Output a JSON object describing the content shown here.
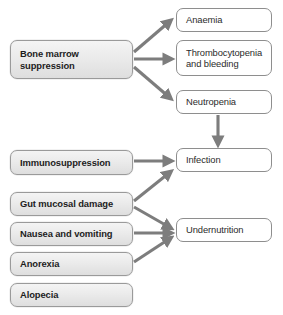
{
  "diagram": {
    "canvas": {
      "width": 283,
      "height": 315
    },
    "colors": {
      "background": "#ffffff",
      "cause_fill_top": "#f4f4f4",
      "cause_fill_bottom": "#dedede",
      "cause_border": "#9a9a9a",
      "effect_fill": "#ffffff",
      "effect_border": "#8e8e8e",
      "arrow": "#7d7d7d",
      "text": "#1d1d1d"
    },
    "nodes": [
      {
        "id": "bone-marrow-suppression",
        "label": "Bone marrow suppression",
        "kind": "cause",
        "x": 10,
        "y": 40,
        "w": 123,
        "h": 39
      },
      {
        "id": "anaemia",
        "label": "Anaemia",
        "kind": "effect",
        "x": 176,
        "y": 8,
        "w": 96,
        "h": 24
      },
      {
        "id": "thrombocytopenia-and-bleeding",
        "label": "Thrombocytopenia and bleeding",
        "kind": "effect",
        "x": 176,
        "y": 40,
        "w": 96,
        "h": 36
      },
      {
        "id": "neutropenia",
        "label": "Neutropenia",
        "kind": "effect",
        "x": 176,
        "y": 90,
        "w": 96,
        "h": 24
      },
      {
        "id": "immunosuppression",
        "label": "Immunosuppression",
        "kind": "cause",
        "x": 10,
        "y": 150,
        "w": 123,
        "h": 25
      },
      {
        "id": "infection",
        "label": "Infection",
        "kind": "effect",
        "x": 176,
        "y": 148,
        "w": 96,
        "h": 24
      },
      {
        "id": "gut-mucosal-damage",
        "label": "Gut mucosal damage",
        "kind": "cause",
        "x": 10,
        "y": 192,
        "w": 123,
        "h": 24
      },
      {
        "id": "nausea-and-vomiting",
        "label": "Nausea and vomiting",
        "kind": "cause",
        "x": 10,
        "y": 222,
        "w": 123,
        "h": 24
      },
      {
        "id": "undernutrition",
        "label": "Undernutrition",
        "kind": "effect",
        "x": 176,
        "y": 218,
        "w": 96,
        "h": 24
      },
      {
        "id": "anorexia",
        "label": "Anorexia",
        "kind": "cause",
        "x": 10,
        "y": 252,
        "w": 123,
        "h": 24
      },
      {
        "id": "alopecia",
        "label": "Alopecia",
        "kind": "cause",
        "x": 10,
        "y": 283,
        "w": 123,
        "h": 24
      }
    ],
    "edges": [
      {
        "id": "bone-marrow-to-anaemia",
        "from": "bone-marrow-suppression",
        "to": "anaemia"
      },
      {
        "id": "bone-marrow-to-thrombocytopenia",
        "from": "bone-marrow-suppression",
        "to": "thrombocytopenia-and-bleeding"
      },
      {
        "id": "bone-marrow-to-neutropenia",
        "from": "bone-marrow-suppression",
        "to": "neutropenia"
      },
      {
        "id": "neutropenia-to-infection",
        "from": "neutropenia",
        "to": "infection"
      },
      {
        "id": "immunosuppression-to-infection",
        "from": "immunosuppression",
        "to": "infection"
      },
      {
        "id": "gut-mucosal-damage-to-infection",
        "from": "gut-mucosal-damage",
        "to": "infection"
      },
      {
        "id": "gut-mucosal-damage-to-undernutrition",
        "from": "gut-mucosal-damage",
        "to": "undernutrition"
      },
      {
        "id": "nausea-to-undernutrition",
        "from": "nausea-and-vomiting",
        "to": "undernutrition"
      },
      {
        "id": "anorexia-to-undernutrition",
        "from": "anorexia",
        "to": "undernutrition"
      }
    ]
  }
}
